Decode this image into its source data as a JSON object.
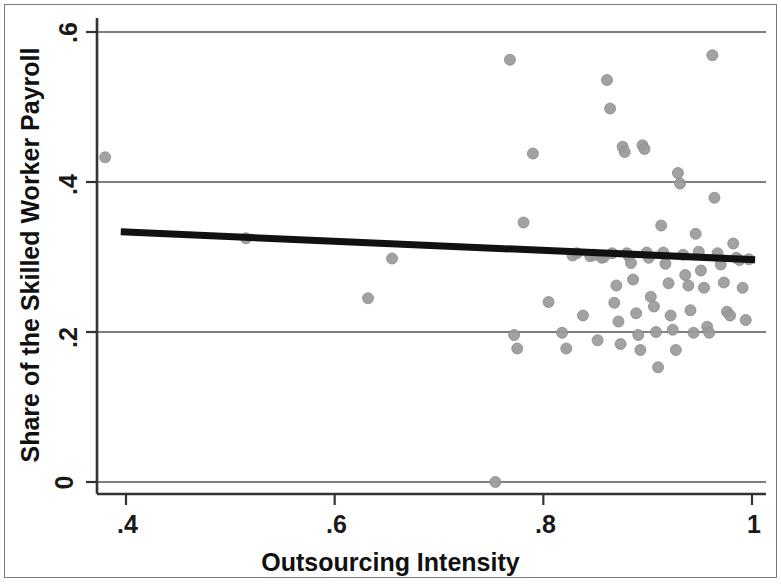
{
  "chart_data": {
    "type": "scatter",
    "title": "",
    "subtitle": "",
    "xlabel": "Outsourcing Intensity",
    "ylabel": "Share of the Skilled Worker Payroll",
    "xlim": [
      0.355,
      1.01
    ],
    "ylim": [
      -0.012,
      0.615
    ],
    "xticks": [
      0.4,
      0.6,
      0.8,
      1
    ],
    "xtick_labels": [
      ".4",
      ".6",
      ".8",
      "1"
    ],
    "yticks": [
      0,
      0.2,
      0.4,
      0.6
    ],
    "ytick_labels": [
      "0",
      ".2",
      ".4",
      ".6"
    ],
    "grid": "horizontal",
    "gridlines_y": [
      0,
      0.2,
      0.4,
      0.6
    ],
    "legend": "none",
    "marker_color": "#9a9a9a",
    "marker_edge_color": "#8a8a8a",
    "marker_size_px": 11,
    "line_color": "#111111",
    "axis_color": "#333333",
    "grid_color": "#555555",
    "background_color": "#ffffff",
    "series": [
      {
        "name": "Establishments",
        "x": [
          0.38,
          0.515,
          0.632,
          0.655,
          0.754,
          0.768,
          0.772,
          0.775,
          0.781,
          0.79,
          0.805,
          0.818,
          0.822,
          0.828,
          0.832,
          0.838,
          0.845,
          0.849,
          0.852,
          0.856,
          0.858,
          0.861,
          0.864,
          0.866,
          0.868,
          0.87,
          0.872,
          0.874,
          0.876,
          0.878,
          0.88,
          0.882,
          0.884,
          0.886,
          0.889,
          0.891,
          0.893,
          0.895,
          0.897,
          0.899,
          0.901,
          0.903,
          0.906,
          0.908,
          0.91,
          0.913,
          0.915,
          0.917,
          0.92,
          0.922,
          0.924,
          0.927,
          0.929,
          0.931,
          0.934,
          0.936,
          0.939,
          0.941,
          0.944,
          0.946,
          0.949,
          0.951,
          0.954,
          0.957,
          0.959,
          0.962,
          0.964,
          0.967,
          0.97,
          0.973,
          0.976,
          0.979,
          0.982,
          0.985,
          0.988,
          0.991,
          0.994,
          0.997
        ],
        "y": [
          0.433,
          0.325,
          0.245,
          0.298,
          0.0,
          0.563,
          0.196,
          0.178,
          0.346,
          0.438,
          0.24,
          0.199,
          0.178,
          0.302,
          0.305,
          0.222,
          0.301,
          0.303,
          0.189,
          0.299,
          0.3,
          0.536,
          0.498,
          0.305,
          0.239,
          0.262,
          0.214,
          0.184,
          0.447,
          0.44,
          0.305,
          0.301,
          0.292,
          0.27,
          0.225,
          0.196,
          0.176,
          0.449,
          0.444,
          0.306,
          0.299,
          0.247,
          0.234,
          0.2,
          0.153,
          0.342,
          0.306,
          0.291,
          0.265,
          0.222,
          0.203,
          0.176,
          0.412,
          0.398,
          0.303,
          0.276,
          0.262,
          0.229,
          0.199,
          0.331,
          0.307,
          0.282,
          0.259,
          0.207,
          0.199,
          0.569,
          0.379,
          0.305,
          0.29,
          0.266,
          0.227,
          0.222,
          0.318,
          0.299,
          0.296,
          0.259,
          0.216,
          0.297
        ]
      }
    ],
    "fit_line": {
      "name": "Linear fit",
      "x_start": 0.395,
      "y_start": 0.3335,
      "x_end": 1.003,
      "y_end": 0.2965,
      "slope": -0.0609,
      "intercept": 0.3576,
      "color": "#111111",
      "width_px": 7
    }
  },
  "axes": {
    "x_title": "Outsourcing Intensity",
    "y_title": "Share of the Skilled Worker Payroll",
    "x_tick_labels": [
      ".4",
      ".6",
      ".8",
      "1"
    ],
    "y_tick_labels": [
      ".6",
      ".4",
      ".2",
      "0"
    ]
  }
}
